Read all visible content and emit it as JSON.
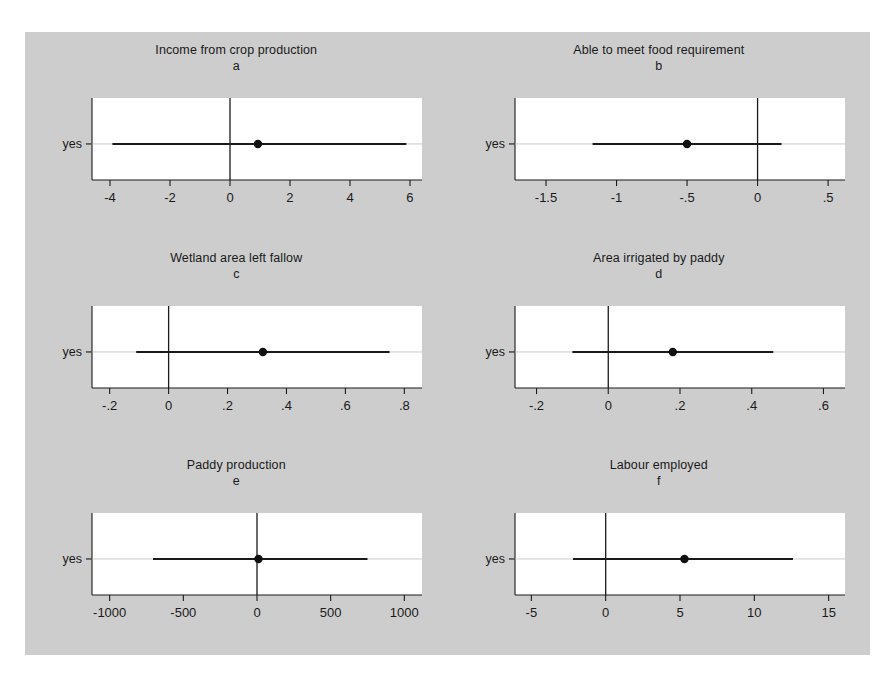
{
  "figure": {
    "background_color": "#cdcdcd",
    "page_background_color": "#ffffff",
    "plot_area_color": "#ffffff",
    "line_color": "#1a1a1a",
    "marker_color": "#101010",
    "category_label": "yes"
  },
  "panels": [
    {
      "id": "a",
      "title": "Income from crop production",
      "letter": "a",
      "ylabel": "yes",
      "xticks": [
        -4,
        -2,
        0,
        2,
        4,
        6
      ],
      "xticklabels": [
        "-4",
        "-2",
        "0",
        "2",
        "4",
        "6"
      ],
      "xlim": [
        -4.6,
        6.4
      ],
      "zero_line": 0,
      "estimate": 0.93,
      "ci_low": -3.92,
      "ci_high": 5.88
    },
    {
      "id": "b",
      "title": "Able to meet food requirement",
      "letter": "b",
      "ylabel": "yes",
      "xticks": [
        -1.5,
        -1,
        -0.5,
        0,
        0.5
      ],
      "xticklabels": [
        "-1.5",
        "-1",
        "-.5",
        "0",
        ".5"
      ],
      "xlim": [
        -1.72,
        0.62
      ],
      "zero_line": 0,
      "estimate": -0.5,
      "ci_low": -1.17,
      "ci_high": 0.17
    },
    {
      "id": "c",
      "title": "Wetland area left fallow",
      "letter": "c",
      "ylabel": "yes",
      "xticks": [
        -0.2,
        0,
        0.2,
        0.4,
        0.6,
        0.8
      ],
      "xticklabels": [
        "-.2",
        "0",
        ".2",
        ".4",
        ".6",
        ".8"
      ],
      "xlim": [
        -0.26,
        0.86
      ],
      "zero_line": 0,
      "estimate": 0.32,
      "ci_low": -0.11,
      "ci_high": 0.75
    },
    {
      "id": "d",
      "title": "Area irrigated by paddy",
      "letter": "d",
      "ylabel": "yes",
      "xticks": [
        -0.2,
        0,
        0.2,
        0.4,
        0.6
      ],
      "xticklabels": [
        "-.2",
        "0",
        ".2",
        ".4",
        ".6"
      ],
      "xlim": [
        -0.26,
        0.66
      ],
      "zero_line": 0,
      "estimate": 0.18,
      "ci_low": -0.1,
      "ci_high": 0.46
    },
    {
      "id": "e",
      "title": "Paddy production",
      "letter": "e",
      "ylabel": "yes",
      "xticks": [
        -1000,
        -500,
        0,
        500,
        1000
      ],
      "xticklabels": [
        "-1000",
        "-500",
        "0",
        "500",
        "1000"
      ],
      "xlim": [
        -1120,
        1120
      ],
      "zero_line": 0,
      "estimate": 10,
      "ci_low": -706,
      "ci_high": 750
    },
    {
      "id": "f",
      "title": "Labour employed",
      "letter": "f",
      "ylabel": "yes",
      "xticks": [
        -5,
        0,
        5,
        10,
        15
      ],
      "xticklabels": [
        "-5",
        "0",
        "5",
        "10",
        "15"
      ],
      "xlim": [
        -6.1,
        16.1
      ],
      "zero_line": 0,
      "estimate": 5.3,
      "ci_low": -2.2,
      "ci_high": 12.6
    }
  ],
  "chart_data": {
    "type": "scatter",
    "subtitle": "",
    "xlabel": "",
    "ylabel": "",
    "legend_position": "none",
    "grid": false,
    "panel_layout": [
      2,
      3
    ],
    "categories": [
      "yes"
    ],
    "series": [
      {
        "name": "a. Income from crop production",
        "category": "yes",
        "estimate": 0.93,
        "ci_low": -3.92,
        "ci_high": 5.88,
        "xlim": [
          -4.6,
          6.4
        ],
        "xticks": [
          -4,
          -2,
          0,
          2,
          4,
          6
        ]
      },
      {
        "name": "b. Able to meet food requirement",
        "category": "yes",
        "estimate": -0.5,
        "ci_low": -1.17,
        "ci_high": 0.17,
        "xlim": [
          -1.72,
          0.62
        ],
        "xticks": [
          -1.5,
          -1,
          -0.5,
          0,
          0.5
        ]
      },
      {
        "name": "c. Wetland area left fallow",
        "category": "yes",
        "estimate": 0.32,
        "ci_low": -0.11,
        "ci_high": 0.75,
        "xlim": [
          -0.26,
          0.86
        ],
        "xticks": [
          -0.2,
          0,
          0.2,
          0.4,
          0.6,
          0.8
        ]
      },
      {
        "name": "d. Area irrigated by paddy",
        "category": "yes",
        "estimate": 0.18,
        "ci_low": -0.1,
        "ci_high": 0.46,
        "xlim": [
          -0.26,
          0.66
        ],
        "xticks": [
          -0.2,
          0,
          0.2,
          0.4,
          0.6
        ]
      },
      {
        "name": "e. Paddy production",
        "category": "yes",
        "estimate": 10,
        "ci_low": -706,
        "ci_high": 750,
        "xlim": [
          -1120,
          1120
        ],
        "xticks": [
          -1000,
          -500,
          0,
          500,
          1000
        ]
      },
      {
        "name": "f. Labour employed",
        "category": "yes",
        "estimate": 5.3,
        "ci_low": -2.2,
        "ci_high": 12.6,
        "xlim": [
          -6.1,
          16.1
        ],
        "xticks": [
          -5,
          0,
          5,
          10,
          15
        ]
      }
    ]
  }
}
